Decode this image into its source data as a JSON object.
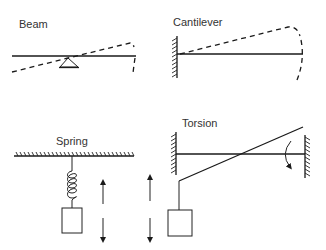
{
  "figure": {
    "panels": [
      {
        "id": "beam",
        "label": "Beam"
      },
      {
        "id": "cantilever",
        "label": "Cantilever"
      },
      {
        "id": "spring",
        "label": "Spring"
      },
      {
        "id": "torsion",
        "label": "Torsion"
      }
    ]
  },
  "icons": {
    "pivot": "triangle-support-icon",
    "wall": "hatched-wall-icon",
    "ceiling": "hatched-ceiling-icon",
    "mass": "square-mass-icon",
    "arrow_up": "arrow-up-icon",
    "arrow_down": "arrow-down-icon",
    "rotation": "curved-rotation-arrow-icon"
  },
  "colors": {
    "line": "#1a1a1a",
    "text": "#333333",
    "background": "#ffffff"
  }
}
